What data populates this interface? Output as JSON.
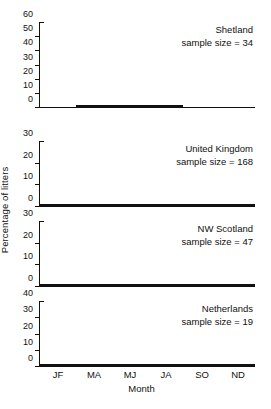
{
  "chart_data": {
    "type": "bar",
    "title": "",
    "xlabel": "Month",
    "ylabel": "Percentage of litters",
    "categories": [
      "JF",
      "MA",
      "MJ",
      "JA",
      "SO",
      "ND"
    ],
    "grid": false,
    "legend": "none",
    "panel_layout": "4 stacked panels sharing x-axis",
    "category_colors": [
      "#ededed",
      "#2e2e2e",
      "#c9c9c9",
      "#a9a9a9",
      "#4d4d4d",
      "#b6b6b6"
    ],
    "bar_outline_color": "#111111",
    "panels": [
      {
        "name": "Shetland",
        "label": "Shetland",
        "sample_size_text": "sample size = 34",
        "sample_size": 34,
        "ylim": [
          0,
          60
        ],
        "yticks": [
          0,
          10,
          20,
          30,
          40,
          50,
          60
        ],
        "values": [
          0,
          11,
          54,
          27,
          0,
          0
        ]
      },
      {
        "name": "United Kingdom",
        "label": "United Kingdom",
        "sample_size_text": "sample size = 168",
        "sample_size": 168,
        "ylim": [
          0,
          30
        ],
        "yticks": [
          0,
          10,
          20,
          30
        ],
        "values": [
          21,
          13.5,
          16,
          16.5,
          17,
          18
        ]
      },
      {
        "name": "NW Scotland",
        "label": "NW Scotland",
        "sample_size_text": "sample size = 47",
        "sample_size": 47,
        "ylim": [
          0,
          30
        ],
        "yticks": [
          0,
          10,
          20,
          30
        ],
        "values": [
          15,
          3,
          22,
          26.5,
          16,
          12.5
        ]
      },
      {
        "name": "Netherlands",
        "label": "Netherlands",
        "sample_size_text": "sample size = 19",
        "sample_size": 19,
        "ylim": [
          0,
          40
        ],
        "yticks": [
          0,
          10,
          20,
          30,
          40
        ],
        "values": [
          11.5,
          11.5,
          22,
          37.5,
          4.5,
          13.5
        ]
      }
    ]
  },
  "figure": {
    "ylabel": "Percentage of litters",
    "xlabel": "Month"
  }
}
